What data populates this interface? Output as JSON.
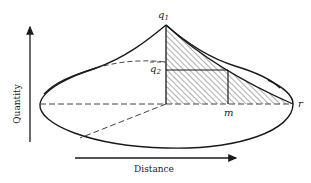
{
  "figure": {
    "type": "diagram",
    "colors": {
      "stroke": "#1a1a1a",
      "dashed": "#444444",
      "hatch": "#333333",
      "background": "#ffffff"
    },
    "axes": {
      "y_label": "Quantity",
      "x_label": "Distance"
    },
    "labels": {
      "q1": {
        "base": "q",
        "sub": "1"
      },
      "q2": {
        "base": "q",
        "sub": "2"
      },
      "m": "m",
      "r": "r"
    }
  }
}
